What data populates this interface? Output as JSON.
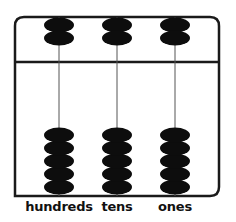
{
  "diagram": {
    "type": "abacus",
    "colors": {
      "frame": "#1a1a1a",
      "bead": "#0d0d0d",
      "rod": "#555555",
      "background": "#ffffff"
    },
    "rods": [
      {
        "label": "hundreds",
        "upper_beads": 2,
        "lower_beads": 5
      },
      {
        "label": "tens",
        "upper_beads": 2,
        "lower_beads": 5
      },
      {
        "label": "ones",
        "upper_beads": 2,
        "lower_beads": 5
      }
    ]
  }
}
